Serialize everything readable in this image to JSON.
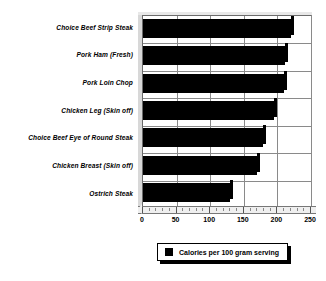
{
  "chart_data": {
    "type": "bar",
    "orientation": "horizontal",
    "title": "",
    "subtitle": "",
    "xlabel": "",
    "ylabel": "",
    "categories": [
      "Choice Beef Strip Steak",
      "Pork Ham (Fresh)",
      "Pork Loin Chop",
      "Chicken Leg (Skin off)",
      "Choice Beef Eye of Round Steak",
      "Chicken Breast (Skin off)",
      "Ostrich Steak"
    ],
    "values": [
      220,
      212,
      210,
      195,
      178,
      170,
      130
    ],
    "series": [
      {
        "name": "Calories per 100 gram serving",
        "values": [
          220,
          212,
          210,
          195,
          178,
          170,
          130
        ]
      }
    ],
    "xlim": [
      0,
      250
    ],
    "xticks": [
      0,
      50,
      100,
      150,
      200,
      250
    ],
    "xtick_labels": [
      "0",
      "50",
      "100",
      "150",
      "200",
      "250"
    ],
    "grid": true,
    "legend": {
      "position": "bottom",
      "entries": [
        {
          "label": "Calories per 100 gram serving",
          "color": "#000000"
        }
      ]
    },
    "bar_color": "#000000",
    "background_color": "#ffffff",
    "style": "3d"
  }
}
